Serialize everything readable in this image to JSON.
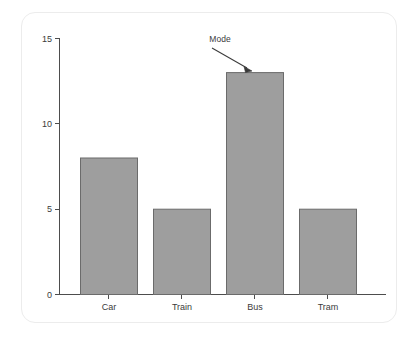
{
  "chart_data": {
    "type": "bar",
    "title": "",
    "subtitle": "",
    "xlabel": "",
    "ylabel": "",
    "categories": [
      "Car",
      "Train",
      "Bus",
      "Tram"
    ],
    "values": [
      8,
      5,
      13,
      5
    ],
    "series": [
      {
        "name": "Count",
        "values": [
          8,
          5,
          13,
          5
        ]
      }
    ],
    "ylim": [
      0,
      15
    ],
    "yticks": [
      "0",
      "5",
      "10",
      "15"
    ],
    "ytick_values": [
      0,
      5,
      10,
      15
    ],
    "grid": false,
    "legend": "none",
    "bar_color": "#9e9e9e",
    "bar_edge_color": "#6b6b6b",
    "axis_color": "#4d4d4d",
    "background_color": "#ffffff",
    "annotations": [
      {
        "label": "Mode",
        "target_category": "Bus",
        "target_value": 13,
        "text_color": "#3b3b3b",
        "arrow_color": "#3a3a3a"
      }
    ]
  },
  "figure": {
    "frame_color": "#ececec"
  }
}
